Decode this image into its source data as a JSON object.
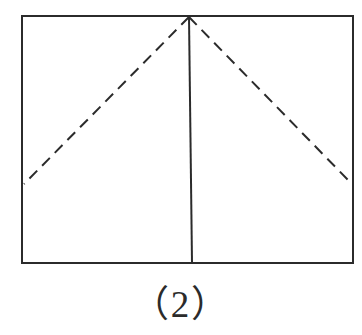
{
  "figure": {
    "caption": "（2）",
    "caption_plain": "(2)",
    "background_color": "#ffffff",
    "stroke_color": "#2b2b2b",
    "solid_stroke_width": 2,
    "dashed_stroke_width": 2,
    "dash_pattern": "11 7",
    "elements": [
      {
        "name": "rectangle-outline",
        "type": "rect",
        "style": "solid",
        "x": 22,
        "y": 16,
        "width": 331,
        "height": 247
      },
      {
        "name": "vertical-center-crease",
        "type": "line",
        "style": "solid",
        "x1": 189,
        "y1": 17,
        "x2": 192,
        "y2": 263
      },
      {
        "name": "left-diagonal-fold",
        "type": "line",
        "style": "dashed",
        "x1": 189,
        "y1": 17,
        "x2": 24,
        "y2": 184
      },
      {
        "name": "right-diagonal-fold",
        "type": "line",
        "style": "dashed",
        "x1": 189,
        "y1": 17,
        "x2": 352,
        "y2": 184
      }
    ],
    "vertices": [
      {
        "name": "top-left-corner",
        "x": 22,
        "y": 16
      },
      {
        "name": "top-right-corner",
        "x": 353,
        "y": 16
      },
      {
        "name": "bottom-right-corner",
        "x": 353,
        "y": 263
      },
      {
        "name": "bottom-left-corner",
        "x": 22,
        "y": 263
      },
      {
        "name": "apex-point",
        "x": 189,
        "y": 17
      },
      {
        "name": "left-edge-fold-point",
        "x": 24,
        "y": 184
      },
      {
        "name": "right-edge-fold-point",
        "x": 352,
        "y": 184
      },
      {
        "name": "bottom-crease-point",
        "x": 192,
        "y": 263
      }
    ]
  }
}
